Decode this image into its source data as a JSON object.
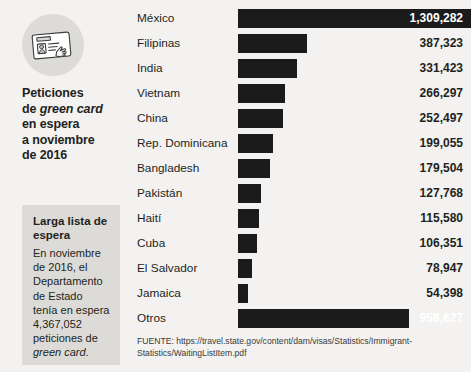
{
  "sidebar": {
    "icon_name": "green-card-id-hand-icon",
    "headline_line1": "Peticiones",
    "headline_line2_pre": "de ",
    "headline_line2_em": "green card",
    "headline_line3": "en espera",
    "headline_line4": "a noviembre",
    "headline_line5": "de 2016",
    "note_title": "Larga lista de espera",
    "note_body_pre": "En noviembre de 2016, el Departamento de Estado tenía en espera 4,367,052 peticiones de ",
    "note_body_em": "green card",
    "note_body_post": "."
  },
  "source": {
    "label": "FUENTE:",
    "url": "https://travel.state.gov/content/dam/visas/Statistics/Immigrant-Statistics/WaitingListItem.pdf",
    "full": "FUENTE: https://travel.state.gov/content/dam/visas/Statistics/Immigrant-Statistics/WaitingListItem.pdf"
  },
  "colors": {
    "background": "#f3f2f0",
    "bar": "#1b1b1b",
    "panel": "#dcdbd8",
    "text": "#231f20",
    "value_inside": "#ffffff"
  },
  "chart_data": {
    "type": "bar",
    "orientation": "horizontal",
    "title": "Peticiones de green card en espera a noviembre de 2016",
    "xlabel": "",
    "ylabel": "",
    "grid": false,
    "legend": "none",
    "xlim": [
      0,
      1309282
    ],
    "total_annotation": 4367052,
    "categories": [
      "México",
      "Filipinas",
      "India",
      "Vietnam",
      "China",
      "Rep. Dominicana",
      "Bangladesh",
      "Pakistán",
      "Haití",
      "Cuba",
      "El Salvador",
      "Jamaica",
      "Otros"
    ],
    "values": [
      1309282,
      387323,
      331423,
      266297,
      252497,
      199055,
      179504,
      127768,
      115580,
      106351,
      78947,
      54398,
      958627
    ],
    "value_labels": [
      "1,309,282",
      "387,323",
      "331,423",
      "266,297",
      "252,497",
      "199,055",
      "179,504",
      "127,768",
      "115,580",
      "106,351",
      "78,947",
      "54,398",
      "958,627"
    ]
  }
}
